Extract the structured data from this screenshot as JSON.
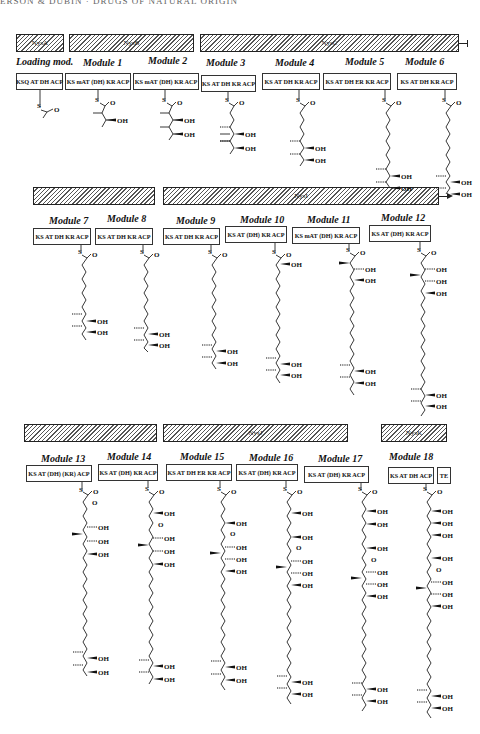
{
  "running_head": "ERSON & DUBIN · DRUGS OF NATURAL ORIGIN",
  "genes": [
    {
      "name": "NysA",
      "row": 1
    },
    {
      "name": "NysB",
      "row": 1
    },
    {
      "name": "NysC",
      "row": 1
    },
    {
      "name": "",
      "row": 2
    },
    {
      "name": "NysI",
      "row": 2
    },
    {
      "name": "",
      "row": 3
    },
    {
      "name": "NysJ",
      "row": 3
    },
    {
      "name": "NysK",
      "row": 3
    }
  ],
  "modules": [
    {
      "title": "Loading mod.",
      "domains": "KSQ AT DH ACP"
    },
    {
      "title": "Module 1",
      "domains": "KS mAT (DH) KR ACP"
    },
    {
      "title": "Module 2",
      "domains": "KS mAT (DH) KR ACP"
    },
    {
      "title": "Module 3",
      "domains": "KS AT DH KR ACP"
    },
    {
      "title": "Module 4",
      "domains": "KS AT DH KR ACP"
    },
    {
      "title": "Module 5",
      "domains": "KS AT DH ER KR ACP"
    },
    {
      "title": "Module 6",
      "domains": "KS AT DH KR ACP"
    },
    {
      "title": "Module 7",
      "domains": "KS AT DH KR ACP"
    },
    {
      "title": "Module 8",
      "domains": "KS AT DH KR ACP"
    },
    {
      "title": "Module 9",
      "domains": "KS AT DH KR ACP"
    },
    {
      "title": "Module 10",
      "domains": "KS AT (DH) KR ACP"
    },
    {
      "title": "Module 11",
      "domains": "KS mAT (DH) KR ACP"
    },
    {
      "title": "Module 12",
      "domains": "KS AT (DH) KR ACP"
    },
    {
      "title": "Module 13",
      "domains": "KS AT (DH) (KR) ACP"
    },
    {
      "title": "Module 14",
      "domains": "KS AT (DH) KR ACP"
    },
    {
      "title": "Module 15",
      "domains": "KS AT DH ER KR ACP"
    },
    {
      "title": "Module 16",
      "domains": "KS AT (DH) KR ACP"
    },
    {
      "title": "Module 17",
      "domains": "KS AT (DH) KR ACP"
    },
    {
      "title": "Module 18",
      "domains": "KS AT DH ACP"
    }
  ],
  "te_label": "TE",
  "chem_labels": {
    "sulfur": "S",
    "oxygen": "O",
    "hydroxyl": "OH"
  }
}
